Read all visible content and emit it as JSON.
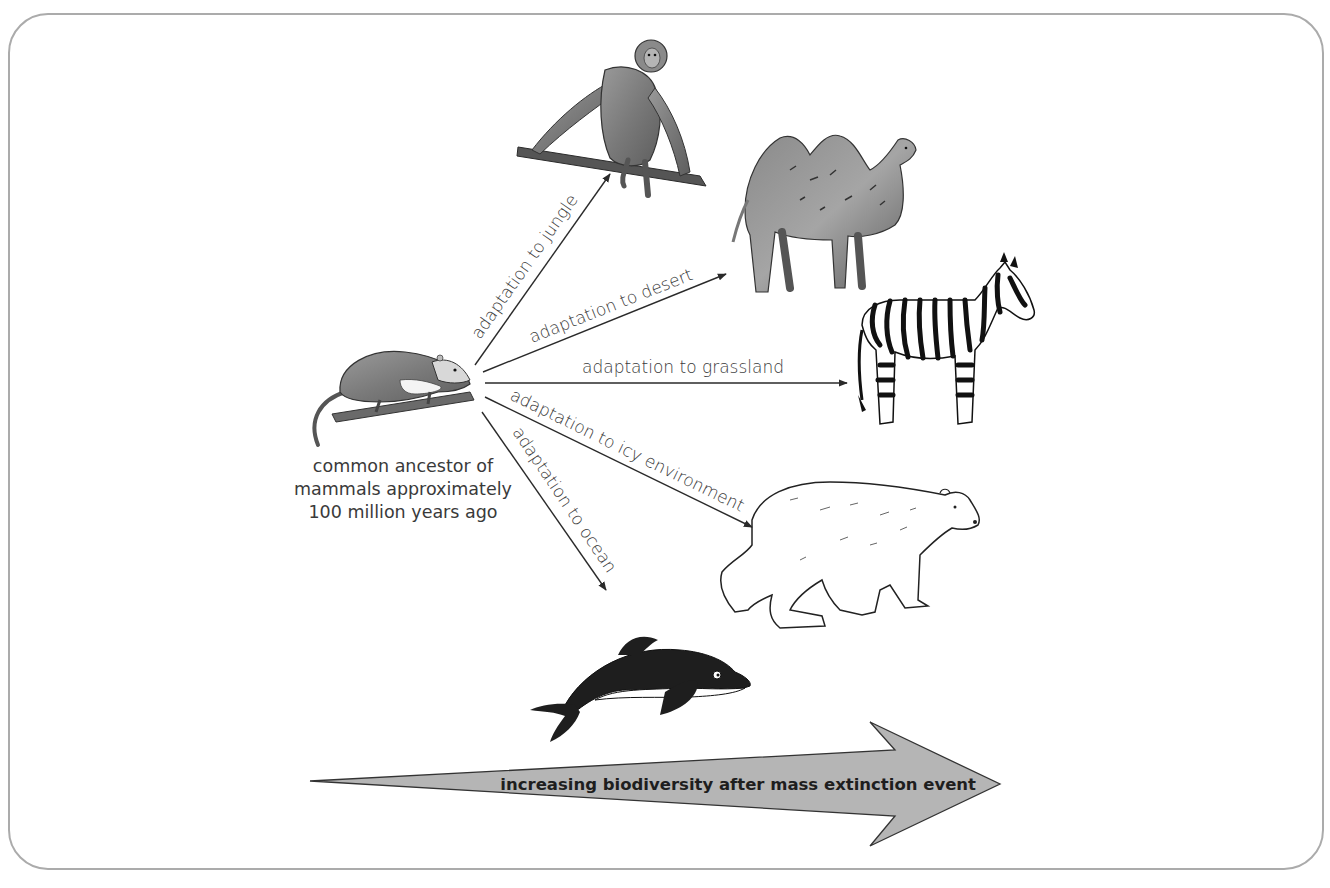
{
  "diagram": {
    "ancestor": {
      "icon": "opossum-like-ancestor-icon",
      "caption_lines": [
        "common ancestor of",
        "mammals approximately",
        "100 million years ago"
      ]
    },
    "branches": [
      {
        "label": "adaptation to jungle",
        "animal": "monkey",
        "icon": "monkey-icon"
      },
      {
        "label": "adaptation to desert",
        "animal": "camel",
        "icon": "camel-icon"
      },
      {
        "label": "adaptation to grassland",
        "animal": "zebra",
        "icon": "zebra-icon"
      },
      {
        "label": "adaptation to icy environment",
        "animal": "polar bear",
        "icon": "polar-bear-icon"
      },
      {
        "label": "adaptation to ocean",
        "animal": "dolphin",
        "icon": "dolphin-icon"
      }
    ],
    "timeline_arrow": {
      "label": "increasing biodiversity after mass extinction event",
      "fill": "#b5b5b5",
      "stroke": "#333333"
    },
    "colors": {
      "frame_border": "#ababab",
      "text": "#3a3a3a",
      "arrow_line": "#2a2a2a"
    }
  }
}
